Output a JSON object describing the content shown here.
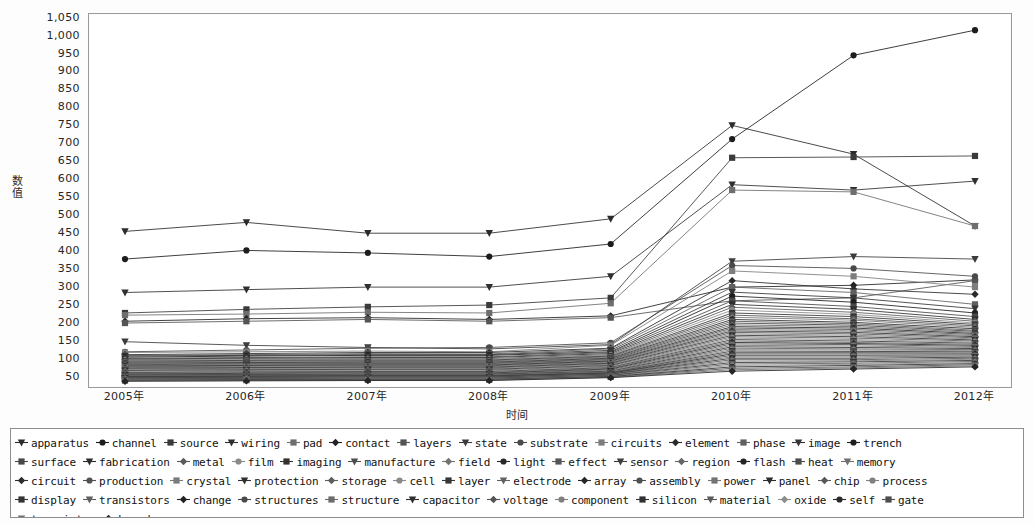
{
  "axes": {
    "y_title": "数值",
    "x_title": "时间",
    "y_ticks": [
      "1,050",
      "1,000",
      "950",
      "900",
      "850",
      "800",
      "750",
      "700",
      "650",
      "600",
      "550",
      "500",
      "450",
      "400",
      "350",
      "300",
      "250",
      "200",
      "150",
      "100",
      "50"
    ],
    "x_ticks": [
      "2005年",
      "2006年",
      "2007年",
      "2008年",
      "2009年",
      "2010年",
      "2011年",
      "2012年"
    ]
  },
  "legend": {
    "rows": [
      [
        "apparatus",
        "channel",
        "source",
        "wiring",
        "pad",
        "contact",
        "layers",
        "state",
        "substrate",
        "circuits",
        "element",
        "phase",
        "image",
        "trench"
      ],
      [
        "surface",
        "fabrication",
        "metal",
        "film",
        "imaging",
        "manufacture",
        "field",
        "light",
        "effect",
        "sensor",
        "region",
        "flash",
        "heat",
        "memory"
      ],
      [
        "circuit",
        "production",
        "crystal",
        "protection",
        "storage",
        "cell",
        "layer",
        "electrode",
        "array",
        "assembly",
        "power",
        "panel",
        "chip",
        "process"
      ],
      [
        "display",
        "transistors",
        "change",
        "structures",
        "structure",
        "capacitor",
        "voltage",
        "component",
        "silicon",
        "material",
        "oxide",
        "self",
        "gate"
      ],
      [
        "transistor",
        "board"
      ]
    ]
  },
  "chart_data": {
    "type": "line",
    "title": "",
    "xlabel": "时间",
    "ylabel": "数值",
    "x": [
      "2005年",
      "2006年",
      "2007年",
      "2008年",
      "2009年",
      "2010年",
      "2011年",
      "2012年"
    ],
    "ylim": [
      20,
      1060
    ],
    "ytick_step": 50,
    "grid": false,
    "legend_position": "bottom",
    "series": [
      {
        "name": "apparatus",
        "values": [
          455,
          480,
          450,
          450,
          490,
          750,
          670,
          470
        ],
        "marker": "triangle-down",
        "color": "#2b2b2b"
      },
      {
        "name": "channel",
        "values": [
          378,
          402,
          395,
          385,
          420,
          712,
          945,
          1015
        ],
        "marker": "circle",
        "color": "#1c1c1c"
      },
      {
        "name": "source",
        "values": [
          228,
          238,
          245,
          250,
          270,
          660,
          662,
          665
        ],
        "marker": "square",
        "color": "#3a3a3a"
      },
      {
        "name": "wiring",
        "values": [
          285,
          293,
          300,
          300,
          330,
          585,
          570,
          595
        ],
        "marker": "triangle-down",
        "color": "#2f2f2f"
      },
      {
        "name": "pad",
        "values": [
          222,
          225,
          230,
          228,
          255,
          570,
          565,
          470
        ],
        "marker": "square",
        "color": "#6e6e6e"
      },
      {
        "name": "contact",
        "values": [
          205,
          212,
          215,
          210,
          220,
          300,
          305,
          320
        ],
        "marker": "diamond",
        "color": "#222222"
      },
      {
        "name": "layers",
        "values": [
          200,
          205,
          210,
          205,
          215,
          262,
          270,
          318
        ],
        "marker": "square",
        "color": "#545454"
      },
      {
        "name": "state",
        "values": [
          148,
          138,
          132,
          128,
          140,
          372,
          385,
          378
        ],
        "marker": "triangle-down",
        "color": "#3c3c3c"
      },
      {
        "name": "substrate",
        "values": [
          120,
          125,
          130,
          132,
          145,
          360,
          352,
          330
        ],
        "marker": "circle",
        "color": "#4a4a4a"
      },
      {
        "name": "circuits",
        "values": [
          118,
          120,
          122,
          120,
          138,
          345,
          330,
          300
        ],
        "marker": "square",
        "color": "#7d7d7d"
      },
      {
        "name": "element",
        "values": [
          112,
          115,
          118,
          118,
          130,
          318,
          295,
          280
        ],
        "marker": "diamond",
        "color": "#2a2a2a"
      },
      {
        "name": "phase",
        "values": [
          110,
          112,
          115,
          114,
          128,
          300,
          285,
          252
        ],
        "marker": "square",
        "color": "#606060"
      },
      {
        "name": "image",
        "values": [
          108,
          110,
          112,
          112,
          124,
          286,
          270,
          240
        ],
        "marker": "triangle-down",
        "color": "#353535"
      },
      {
        "name": "trench",
        "values": [
          105,
          108,
          110,
          110,
          120,
          275,
          258,
          228
        ],
        "marker": "circle",
        "color": "#1f1f1f"
      },
      {
        "name": "surface",
        "values": [
          102,
          104,
          106,
          106,
          118,
          262,
          246,
          218
        ],
        "marker": "square",
        "color": "#484848"
      },
      {
        "name": "fabrication",
        "values": [
          100,
          102,
          104,
          104,
          115,
          252,
          238,
          210
        ],
        "marker": "triangle-down",
        "color": "#2e2e2e"
      },
      {
        "name": "metal",
        "values": [
          98,
          100,
          101,
          101,
          112,
          244,
          230,
          205
        ],
        "marker": "diamond",
        "color": "#5b5b5b"
      },
      {
        "name": "film",
        "values": [
          96,
          98,
          99,
          99,
          110,
          236,
          224,
          200
        ],
        "marker": "circle",
        "color": "#8a8a8a"
      },
      {
        "name": "imaging",
        "values": [
          94,
          96,
          97,
          97,
          108,
          228,
          218,
          196
        ],
        "marker": "square",
        "color": "#333333"
      },
      {
        "name": "manufacture",
        "values": [
          92,
          94,
          95,
          95,
          106,
          222,
          212,
          192
        ],
        "marker": "triangle-down",
        "color": "#4e4e4e"
      },
      {
        "name": "field",
        "values": [
          90,
          92,
          93,
          93,
          104,
          216,
          208,
          188
        ],
        "marker": "diamond",
        "color": "#737373"
      },
      {
        "name": "light",
        "values": [
          88,
          90,
          91,
          91,
          102,
          210,
          202,
          184
        ],
        "marker": "circle",
        "color": "#282828"
      },
      {
        "name": "effect",
        "values": [
          86,
          88,
          89,
          89,
          100,
          205,
          198,
          180
        ],
        "marker": "square",
        "color": "#565656"
      },
      {
        "name": "sensor",
        "values": [
          84,
          86,
          87,
          87,
          98,
          200,
          194,
          177
        ],
        "marker": "triangle-down",
        "color": "#3f3f3f"
      },
      {
        "name": "region",
        "values": [
          82,
          84,
          85,
          85,
          96,
          195,
          190,
          174
        ],
        "marker": "diamond",
        "color": "#666666"
      },
      {
        "name": "flash",
        "values": [
          80,
          82,
          83,
          83,
          94,
          190,
          186,
          171
        ],
        "marker": "circle",
        "color": "#242424"
      },
      {
        "name": "heat",
        "values": [
          78,
          80,
          81,
          81,
          92,
          186,
          182,
          168
        ],
        "marker": "square",
        "color": "#4c4c4c"
      },
      {
        "name": "memory",
        "values": [
          76,
          78,
          79,
          79,
          90,
          182,
          178,
          165
        ],
        "marker": "triangle-down",
        "color": "#707070"
      },
      {
        "name": "circuit",
        "values": [
          74,
          76,
          77,
          77,
          88,
          178,
          174,
          162
        ],
        "marker": "diamond",
        "color": "#2c2c2c"
      },
      {
        "name": "production",
        "values": [
          72,
          74,
          75,
          75,
          86,
          174,
          170,
          159
        ],
        "marker": "circle",
        "color": "#515151"
      },
      {
        "name": "crystal",
        "values": [
          70,
          72,
          73,
          73,
          84,
          170,
          166,
          156
        ],
        "marker": "square",
        "color": "#7b7b7b"
      },
      {
        "name": "protection",
        "values": [
          68,
          70,
          71,
          71,
          82,
          166,
          162,
          153
        ],
        "marker": "triangle-down",
        "color": "#303030"
      },
      {
        "name": "storage",
        "values": [
          66,
          68,
          69,
          69,
          80,
          162,
          158,
          150
        ],
        "marker": "diamond",
        "color": "#5d5d5d"
      },
      {
        "name": "cell",
        "values": [
          64,
          66,
          67,
          67,
          78,
          158,
          154,
          147
        ],
        "marker": "circle",
        "color": "#898989"
      },
      {
        "name": "layer",
        "values": [
          62,
          64,
          65,
          65,
          76,
          154,
          150,
          144
        ],
        "marker": "square",
        "color": "#373737"
      },
      {
        "name": "electrode",
        "values": [
          60,
          62,
          63,
          63,
          74,
          150,
          146,
          141
        ],
        "marker": "triangle-down",
        "color": "#626262"
      },
      {
        "name": "array",
        "values": [
          58,
          60,
          61,
          61,
          72,
          146,
          143,
          138
        ],
        "marker": "diamond",
        "color": "#262626"
      },
      {
        "name": "assembly",
        "values": [
          57,
          58,
          59,
          59,
          70,
          142,
          140,
          135
        ],
        "marker": "circle",
        "color": "#4f4f4f"
      },
      {
        "name": "power",
        "values": [
          56,
          57,
          58,
          58,
          68,
          138,
          136,
          132
        ],
        "marker": "square",
        "color": "#747474"
      },
      {
        "name": "panel",
        "values": [
          55,
          56,
          57,
          57,
          66,
          134,
          132,
          129
        ],
        "marker": "triangle-down",
        "color": "#2d2d2d"
      },
      {
        "name": "chip",
        "values": [
          54,
          55,
          56,
          56,
          64,
          130,
          128,
          126
        ],
        "marker": "diamond",
        "color": "#585858"
      },
      {
        "name": "process",
        "values": [
          53,
          54,
          55,
          55,
          63,
          126,
          125,
          123
        ],
        "marker": "circle",
        "color": "#808080"
      },
      {
        "name": "display",
        "values": [
          52,
          53,
          54,
          54,
          62,
          122,
          121,
          120
        ],
        "marker": "square",
        "color": "#343434"
      },
      {
        "name": "transistors",
        "values": [
          51,
          52,
          53,
          53,
          61,
          118,
          118,
          117
        ],
        "marker": "triangle-down",
        "color": "#5f5f5f"
      },
      {
        "name": "change",
        "values": [
          50,
          51,
          52,
          52,
          60,
          114,
          114,
          114
        ],
        "marker": "diamond",
        "color": "#232323"
      },
      {
        "name": "structures",
        "values": [
          49,
          50,
          51,
          51,
          59,
          110,
          110,
          111
        ],
        "marker": "circle",
        "color": "#4b4b4b"
      },
      {
        "name": "structure",
        "values": [
          48,
          49,
          50,
          50,
          58,
          106,
          106,
          108
        ],
        "marker": "square",
        "color": "#6b6b6b"
      },
      {
        "name": "capacitor",
        "values": [
          47,
          48,
          49,
          49,
          57,
          102,
          102,
          105
        ],
        "marker": "triangle-down",
        "color": "#2f2f2f"
      },
      {
        "name": "voltage",
        "values": [
          46,
          47,
          48,
          48,
          56,
          98,
          98,
          102
        ],
        "marker": "diamond",
        "color": "#555555"
      },
      {
        "name": "component",
        "values": [
          45,
          46,
          47,
          47,
          55,
          94,
          95,
          99
        ],
        "marker": "circle",
        "color": "#7f7f7f"
      },
      {
        "name": "silicon",
        "values": [
          44,
          45,
          46,
          46,
          54,
          90,
          92,
          96
        ],
        "marker": "square",
        "color": "#313131"
      },
      {
        "name": "material",
        "values": [
          43,
          44,
          45,
          45,
          53,
          86,
          88,
          93
        ],
        "marker": "triangle-down",
        "color": "#5a5a5a"
      },
      {
        "name": "oxide",
        "values": [
          42,
          43,
          44,
          44,
          52,
          82,
          85,
          90
        ],
        "marker": "diamond",
        "color": "#8c8c8c"
      },
      {
        "name": "self",
        "values": [
          41,
          42,
          43,
          43,
          51,
          78,
          82,
          87
        ],
        "marker": "circle",
        "color": "#292929"
      },
      {
        "name": "gate",
        "values": [
          40,
          41,
          42,
          42,
          50,
          74,
          78,
          84
        ],
        "marker": "square",
        "color": "#4d4d4d"
      },
      {
        "name": "transistor",
        "values": [
          39,
          40,
          41,
          41,
          49,
          70,
          75,
          81
        ],
        "marker": "triangle-down",
        "color": "#6f6f6f"
      },
      {
        "name": "board",
        "values": [
          38,
          39,
          40,
          40,
          48,
          66,
          72,
          78
        ],
        "marker": "diamond",
        "color": "#252525"
      }
    ]
  }
}
